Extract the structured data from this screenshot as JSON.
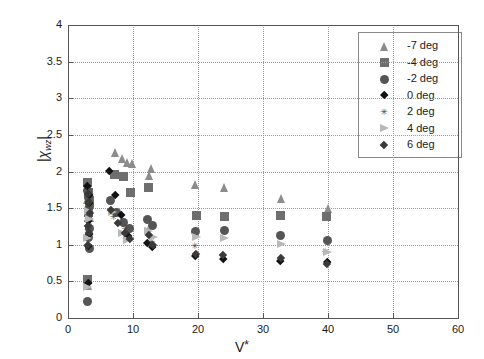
{
  "chart_data": {
    "type": "scatter",
    "title": "",
    "xlabel": "V*",
    "ylabel": "|χwz|",
    "ylabel_parts": {
      "bar_left": "|",
      "chi": "χ",
      "sub": "wz",
      "bar_right": "|"
    },
    "xlabel_parts": {
      "base": "V",
      "star": "*"
    },
    "xlim": [
      0,
      60
    ],
    "ylim": [
      0,
      4
    ],
    "xticks": [
      0,
      10,
      20,
      30,
      40,
      50,
      60
    ],
    "yticks": [
      0,
      0.5,
      1,
      1.5,
      2,
      2.5,
      3,
      3.5,
      4
    ],
    "xticklabels": [
      "0",
      "10",
      "20",
      "30",
      "40",
      "50",
      "60"
    ],
    "yticklabels": [
      "0",
      "0.5",
      "1",
      "1.5",
      "2",
      "2.5",
      "3",
      "3.5",
      "4"
    ],
    "grid": true,
    "grid_style": "dotted",
    "legend_position": "upper right",
    "series": [
      {
        "name": "-7 deg",
        "label": "-7 deg",
        "marker": "triangle",
        "color": "#8c8c8c",
        "size": 9,
        "points": [
          [
            3.0,
            1.62
          ],
          [
            3.2,
            1.48
          ],
          [
            3.4,
            1.37
          ],
          [
            3.3,
            1.3
          ],
          [
            7.3,
            2.26
          ],
          [
            8.4,
            2.18
          ],
          [
            9.2,
            2.12
          ],
          [
            9.9,
            2.11
          ],
          [
            12.6,
            1.95
          ],
          [
            12.9,
            2.04
          ],
          [
            19.6,
            1.82
          ],
          [
            24.0,
            1.78
          ],
          [
            32.8,
            1.63
          ],
          [
            40.0,
            1.5
          ],
          [
            3.1,
            0.45
          ]
        ]
      },
      {
        "name": "-4 deg",
        "label": "-4 deg",
        "marker": "square",
        "color": "#6e6e6e",
        "size": 9,
        "points": [
          [
            3.0,
            1.85
          ],
          [
            3.2,
            1.72
          ],
          [
            3.3,
            1.6
          ],
          [
            3.1,
            1.44
          ],
          [
            7.2,
            1.96
          ],
          [
            8.6,
            1.93
          ],
          [
            9.6,
            1.72
          ],
          [
            12.4,
            1.78
          ],
          [
            19.8,
            1.4
          ],
          [
            24.0,
            1.38
          ],
          [
            32.7,
            1.4
          ],
          [
            39.8,
            1.38
          ],
          [
            3.05,
            0.52
          ]
        ]
      },
      {
        "name": "-2 deg",
        "label": "-2 deg",
        "marker": "circle",
        "color": "#555555",
        "size": 9,
        "points": [
          [
            3.0,
            1.74
          ],
          [
            3.2,
            1.64
          ],
          [
            3.3,
            1.52
          ],
          [
            3.15,
            1.41
          ],
          [
            3.25,
            1.22
          ],
          [
            3.1,
            1.1
          ],
          [
            3.3,
            0.95
          ],
          [
            6.6,
            1.6
          ],
          [
            7.4,
            1.44
          ],
          [
            8.6,
            1.3
          ],
          [
            9.4,
            1.22
          ],
          [
            12.3,
            1.34
          ],
          [
            13.0,
            1.26
          ],
          [
            19.6,
            1.18
          ],
          [
            24.0,
            1.2
          ],
          [
            32.7,
            1.12
          ],
          [
            39.9,
            1.06
          ],
          [
            3.05,
            0.22
          ]
        ]
      },
      {
        "name": "0 deg",
        "label": "0 deg",
        "marker": "diamond",
        "color": "#111111",
        "size": 9,
        "points": [
          [
            3.0,
            1.8
          ],
          [
            3.2,
            1.68
          ],
          [
            3.3,
            1.56
          ],
          [
            3.1,
            1.32
          ],
          [
            3.25,
            1.14
          ],
          [
            3.15,
            0.98
          ],
          [
            6.4,
            2.0
          ],
          [
            7.2,
            1.68
          ],
          [
            8.2,
            1.4
          ],
          [
            9.3,
            1.12
          ],
          [
            12.2,
            1.02
          ],
          [
            12.9,
            0.96
          ],
          [
            19.5,
            0.84
          ],
          [
            23.9,
            0.8
          ],
          [
            32.6,
            0.78
          ],
          [
            39.9,
            0.76
          ],
          [
            3.05,
            0.47
          ]
        ]
      },
      {
        "name": "2 deg",
        "label": "2 deg",
        "marker": "star",
        "color": "#444444",
        "size": 8,
        "points": [
          [
            3.1,
            1.52
          ],
          [
            3.2,
            1.38
          ],
          [
            3.05,
            1.2
          ],
          [
            7.0,
            1.38
          ],
          [
            8.8,
            1.22
          ],
          [
            12.2,
            1.2
          ],
          [
            12.8,
            1.04
          ],
          [
            19.5,
            0.98
          ],
          [
            39.6,
            0.9
          ]
        ]
      },
      {
        "name": "4 deg",
        "label": "4 deg",
        "marker": "right-triangle",
        "color": "#b8b8b8",
        "size": 9,
        "points": [
          [
            3.1,
            1.46
          ],
          [
            3.25,
            1.34
          ],
          [
            3.0,
            1.08
          ],
          [
            6.8,
            1.44
          ],
          [
            8.4,
            1.16
          ],
          [
            9.2,
            1.06
          ],
          [
            12.4,
            1.18
          ],
          [
            13.1,
            1.1
          ],
          [
            19.7,
            1.1
          ],
          [
            24.1,
            1.08
          ],
          [
            32.8,
            1.0
          ],
          [
            39.9,
            0.9
          ],
          [
            3.05,
            0.42
          ]
        ]
      },
      {
        "name": "6 deg",
        "label": "6 deg",
        "marker": "diamond-small",
        "color": "#3a3a3a",
        "size": 8,
        "points": [
          [
            3.0,
            1.7
          ],
          [
            3.2,
            1.58
          ],
          [
            3.3,
            1.44
          ],
          [
            3.1,
            1.26
          ],
          [
            3.22,
            1.16
          ],
          [
            3.05,
            1.0
          ],
          [
            6.6,
            1.48
          ],
          [
            7.6,
            1.3
          ],
          [
            8.8,
            1.16
          ],
          [
            9.5,
            1.08
          ],
          [
            12.4,
            1.14
          ],
          [
            13.0,
            1.0
          ],
          [
            19.6,
            0.88
          ],
          [
            23.9,
            0.86
          ],
          [
            32.7,
            0.82
          ],
          [
            39.8,
            0.74
          ]
        ]
      }
    ]
  },
  "legend": {
    "entries": [
      {
        "label": "-7 deg"
      },
      {
        "label": "-4 deg"
      },
      {
        "label": "-2 deg"
      },
      {
        "label": "0 deg"
      },
      {
        "label": "2 deg"
      },
      {
        "label": "4 deg"
      },
      {
        "label": "6 deg"
      }
    ]
  }
}
